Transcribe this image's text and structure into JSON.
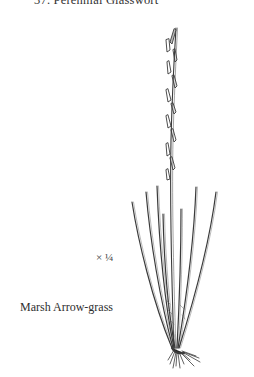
{
  "plate": {
    "top_caption": "37. Perennial Glasswort",
    "scale_label": "× ¼",
    "species_name": "Marsh Arrow-grass"
  },
  "illustration": {
    "subject": "marsh-arrow-grass-plant",
    "ink_color": "#3a3a3a",
    "background": "#ffffff"
  }
}
